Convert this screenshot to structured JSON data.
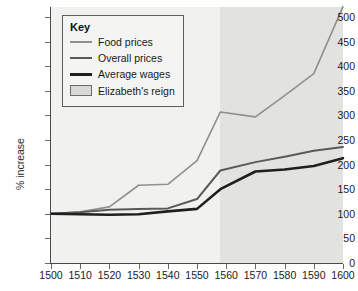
{
  "chart_data": {
    "type": "line",
    "title": "",
    "xlabel": "",
    "ylabel": "% increase",
    "xlim": [
      1500,
      1600
    ],
    "ylim": [
      0,
      500
    ],
    "xticks": [
      1500,
      1510,
      1520,
      1530,
      1540,
      1550,
      1560,
      1570,
      1580,
      1590,
      1600
    ],
    "yticks": [
      0,
      50,
      100,
      150,
      200,
      250,
      300,
      350,
      400,
      450,
      500
    ],
    "grid": false,
    "legend_position": "top-left",
    "legend_title": "Key",
    "x": [
      1500,
      1510,
      1520,
      1530,
      1540,
      1550,
      1558,
      1570,
      1580,
      1590,
      1600
    ],
    "series": [
      {
        "name": "Food prices",
        "color": "#8f8f8f",
        "width": 1.6,
        "values": [
          100,
          104,
          114,
          158,
          160,
          208,
          307,
          297,
          340,
          385,
          521
        ]
      },
      {
        "name": "Overall prices",
        "color": "#5a5a5a",
        "width": 2.0,
        "values": [
          100,
          103,
          108,
          110,
          111,
          130,
          188,
          205,
          216,
          228,
          236
        ]
      },
      {
        "name": "Average wages",
        "color": "#1f1f1f",
        "width": 2.6,
        "values": [
          100,
          99,
          98,
          99,
          105,
          110,
          150,
          186,
          190,
          197,
          213
        ]
      }
    ],
    "annotations": [
      {
        "name": "Elizabeth's reign",
        "type": "span",
        "x_start": 1558,
        "x_end": 1600,
        "color": "#e2e2e1"
      }
    ]
  },
  "legend": {
    "title": "Key",
    "items": [
      {
        "label": "Food prices",
        "marker": "line",
        "color": "#8f8f8f"
      },
      {
        "label": "Overall prices",
        "marker": "line",
        "color": "#5a5a5a"
      },
      {
        "label": "Average wages",
        "marker": "line",
        "color": "#1f1f1f"
      },
      {
        "label": "Elizabeth's reign",
        "marker": "swatch",
        "color": "#d9d9d8"
      }
    ]
  },
  "axes": {
    "y_title": "% increase",
    "y_tick_labels": [
      "500",
      "450",
      "400",
      "350",
      "300",
      "250",
      "200",
      "150",
      "100",
      "50",
      "0"
    ],
    "x_tick_labels": [
      "1500",
      "1510",
      "1520",
      "1530",
      "1540",
      "1550",
      "1560",
      "1570",
      "1580",
      "1590",
      "1600"
    ]
  }
}
